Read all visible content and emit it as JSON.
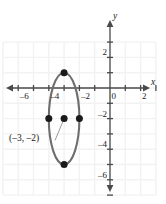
{
  "chart_data": {
    "type": "scatter",
    "title": "",
    "xlabel": "x",
    "ylabel": "y",
    "xlim": [
      -7.2,
      3.4
    ],
    "ylim": [
      -7.6,
      3.2
    ],
    "grid": true,
    "grid_spacing": 1,
    "grid_color": "#f2f2f2",
    "axis_color": "#4a4a4a",
    "curve_color": "#6e6e6e",
    "point_color": "#1a1a1a",
    "x_ticks": [
      -6,
      -5,
      -4,
      -3,
      -2,
      -1,
      0,
      1,
      2,
      3
    ],
    "y_ticks": [
      3,
      2,
      1,
      -1,
      -2,
      -3,
      -4,
      -5,
      -6,
      -7
    ],
    "x_tick_labels": [
      {
        "value": -6,
        "text": "–6"
      },
      {
        "value": -4,
        "text": "–4"
      },
      {
        "value": -2,
        "text": "–2"
      },
      {
        "value": 0,
        "text": "0"
      },
      {
        "value": 2,
        "text": "2"
      }
    ],
    "y_tick_labels": [
      {
        "value": 2,
        "text": "2"
      },
      {
        "value": -2,
        "text": "–2"
      },
      {
        "value": -4,
        "text": "–4"
      },
      {
        "value": -6,
        "text": "–6"
      }
    ],
    "shapes": [
      {
        "kind": "ellipse",
        "center": [
          -3,
          -2
        ],
        "semi_axis_x": 1,
        "semi_axis_y": 3,
        "orientation": "vertical-major"
      }
    ],
    "points": [
      {
        "label": "top-vertex",
        "x": -3,
        "y": 1
      },
      {
        "label": "left-vertex",
        "x": -4,
        "y": -2
      },
      {
        "label": "center",
        "x": -3,
        "y": -2
      },
      {
        "label": "right-vertex",
        "x": -2,
        "y": -2
      },
      {
        "label": "bottom-vertex",
        "x": -3,
        "y": -5
      }
    ],
    "annotations": [
      {
        "text": "(–3, –2)",
        "target_point": [
          -3,
          -2
        ],
        "text_x": -6.6,
        "text_y": -3.75
      }
    ]
  }
}
